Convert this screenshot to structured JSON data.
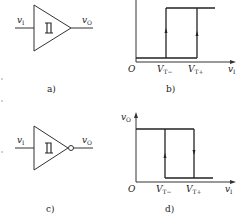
{
  "panels": {
    "a": {
      "caption": "a)",
      "type": "schmitt-buffer",
      "input_label": "v",
      "input_sub": "I",
      "output_label": "v",
      "output_sub": "O"
    },
    "b": {
      "caption": "b)",
      "type": "hysteresis-noninverting",
      "origin": "O",
      "x_label": "v",
      "x_sub": "I",
      "thresholds": [
        {
          "label": "V",
          "sub": "T−"
        },
        {
          "label": "V",
          "sub": "T+"
        }
      ]
    },
    "c": {
      "caption": "c)",
      "type": "schmitt-inverter",
      "input_label": "v",
      "input_sub": "I",
      "output_label": "v",
      "output_sub": "O"
    },
    "d": {
      "caption": "d)",
      "type": "hysteresis-inverting",
      "origin": "O",
      "y_label": "v",
      "y_sub": "O",
      "x_label": "v",
      "x_sub": "I",
      "thresholds": [
        {
          "label": "V",
          "sub": "T−"
        },
        {
          "label": "V",
          "sub": "T+"
        }
      ]
    }
  }
}
